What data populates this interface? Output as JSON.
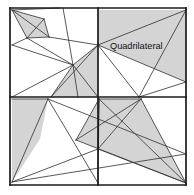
{
  "figure": {
    "name": "quadrilateral-subdivision-diagram",
    "label": "Quadrilateral",
    "label_position": {
      "x": 110,
      "y": 49
    },
    "colors": {
      "background": "#ffffff",
      "shaded_fill": "#d4d4d4",
      "stroke_thin": "#3a3a3a",
      "stroke_thick": "#1a1a1a",
      "frame": "#1a1a1a",
      "label_text": "#111111"
    },
    "frame": {
      "x": 10,
      "y": 8,
      "width": 176,
      "height": 177,
      "center_x": 98,
      "center_y": 97
    },
    "shaded_regions": [
      {
        "name": "top-left-small-quad",
        "points": "12,10 44,19 49,37 27,38"
      },
      {
        "name": "top-left-center-quad",
        "points": "73,65 98,45 98,97 51,97"
      },
      {
        "name": "top-right-big-quad",
        "points": "98,10 186,10 186,82 98,45"
      },
      {
        "name": "bottom-left-quad",
        "points": "12,99 48,99 40,139 12,182"
      },
      {
        "name": "bottom-right-quad",
        "points": "99,99 141,99 186,183 76,140"
      }
    ],
    "segments_thin": [
      {
        "name": "tl-seg-1",
        "x1": 12,
        "y1": 10,
        "x2": 44,
        "y2": 19
      },
      {
        "name": "tl-seg-2",
        "x1": 44,
        "y1": 19,
        "x2": 49,
        "y2": 37
      },
      {
        "name": "tl-seg-3",
        "x1": 49,
        "y1": 37,
        "x2": 27,
        "y2": 38
      },
      {
        "name": "tl-seg-4",
        "x1": 27,
        "y1": 38,
        "x2": 12,
        "y2": 10
      },
      {
        "name": "tl-seg-5",
        "x1": 12,
        "y1": 10,
        "x2": 49,
        "y2": 37
      },
      {
        "name": "tl-seg-6",
        "x1": 44,
        "y1": 19,
        "x2": 27,
        "y2": 38
      },
      {
        "name": "tl-seg-7",
        "x1": 12,
        "y1": 10,
        "x2": 60,
        "y2": 8
      },
      {
        "name": "tl-seg-8",
        "x1": 12,
        "y1": 45,
        "x2": 27,
        "y2": 38
      },
      {
        "name": "tl-seg-9",
        "x1": 12,
        "y1": 45,
        "x2": 73,
        "y2": 65
      },
      {
        "name": "tl-seg-10",
        "x1": 49,
        "y1": 37,
        "x2": 98,
        "y2": 45
      },
      {
        "name": "tl-seg-11",
        "x1": 27,
        "y1": 38,
        "x2": 73,
        "y2": 65
      },
      {
        "name": "tl-seg-12",
        "x1": 73,
        "y1": 65,
        "x2": 98,
        "y2": 45
      },
      {
        "name": "tl-seg-13",
        "x1": 73,
        "y1": 65,
        "x2": 51,
        "y2": 97
      },
      {
        "name": "tl-seg-14",
        "x1": 73,
        "y1": 65,
        "x2": 98,
        "y2": 97
      },
      {
        "name": "tl-seg-15",
        "x1": 73,
        "y1": 65,
        "x2": 63,
        "y2": 8
      },
      {
        "name": "tl-seg-16",
        "x1": 73,
        "y1": 65,
        "x2": 78,
        "y2": 97
      },
      {
        "name": "tl-seg-17",
        "x1": 51,
        "y1": 97,
        "x2": 98,
        "y2": 45
      },
      {
        "name": "tl-seg-18",
        "x1": 12,
        "y1": 97,
        "x2": 73,
        "y2": 65
      },
      {
        "name": "tr-seg-1",
        "x1": 98,
        "y1": 45,
        "x2": 186,
        "y2": 10
      },
      {
        "name": "tr-seg-2",
        "x1": 98,
        "y1": 45,
        "x2": 186,
        "y2": 82
      },
      {
        "name": "tr-seg-3",
        "x1": 186,
        "y1": 10,
        "x2": 139,
        "y2": 97
      },
      {
        "name": "tr-seg-4",
        "x1": 98,
        "y1": 45,
        "x2": 139,
        "y2": 97
      },
      {
        "name": "tr-seg-5",
        "x1": 186,
        "y1": 82,
        "x2": 139,
        "y2": 97
      },
      {
        "name": "bl-seg-1",
        "x1": 12,
        "y1": 99,
        "x2": 48,
        "y2": 99
      },
      {
        "name": "bl-seg-2",
        "x1": 48,
        "y1": 99,
        "x2": 12,
        "y2": 182
      },
      {
        "name": "bl-seg-3",
        "x1": 48,
        "y1": 99,
        "x2": 186,
        "y2": 154
      },
      {
        "name": "bl-seg-4",
        "x1": 12,
        "y1": 182,
        "x2": 186,
        "y2": 154
      },
      {
        "name": "bl-seg-5",
        "x1": 12,
        "y1": 182,
        "x2": 98,
        "y2": 149
      },
      {
        "name": "bl-seg-6",
        "x1": 48,
        "y1": 99,
        "x2": 98,
        "y2": 183
      },
      {
        "name": "br-seg-1",
        "x1": 99,
        "y1": 99,
        "x2": 141,
        "y2": 99
      },
      {
        "name": "br-seg-2",
        "x1": 141,
        "y1": 99,
        "x2": 186,
        "y2": 183
      },
      {
        "name": "br-seg-3",
        "x1": 186,
        "y1": 183,
        "x2": 76,
        "y2": 140
      },
      {
        "name": "br-seg-4",
        "x1": 76,
        "y1": 140,
        "x2": 99,
        "y2": 99
      },
      {
        "name": "br-seg-5",
        "x1": 99,
        "y1": 99,
        "x2": 186,
        "y2": 183
      },
      {
        "name": "br-seg-6",
        "x1": 141,
        "y1": 99,
        "x2": 76,
        "y2": 140
      },
      {
        "name": "br-seg-7",
        "x1": 99,
        "y1": 99,
        "x2": 98,
        "y2": 183
      },
      {
        "name": "br-seg-8",
        "x1": 98,
        "y1": 149,
        "x2": 186,
        "y2": 183
      },
      {
        "name": "br-seg-9",
        "x1": 141,
        "y1": 99,
        "x2": 98,
        "y2": 149
      },
      {
        "name": "br-seg-10",
        "x1": 98,
        "y1": 149,
        "x2": 99,
        "y2": 99
      }
    ],
    "segments_thick": [
      {
        "name": "frame-top",
        "x1": 10,
        "y1": 8,
        "x2": 186,
        "y2": 8
      },
      {
        "name": "frame-right",
        "x1": 186,
        "y1": 8,
        "x2": 186,
        "y2": 185
      },
      {
        "name": "frame-bottom",
        "x1": 10,
        "y1": 185,
        "x2": 186,
        "y2": 185
      },
      {
        "name": "frame-left",
        "x1": 10,
        "y1": 8,
        "x2": 10,
        "y2": 185
      },
      {
        "name": "cross-horizontal",
        "x1": 10,
        "y1": 97,
        "x2": 186,
        "y2": 97
      },
      {
        "name": "cross-vertical",
        "x1": 98,
        "y1": 8,
        "x2": 98,
        "y2": 185
      }
    ]
  }
}
